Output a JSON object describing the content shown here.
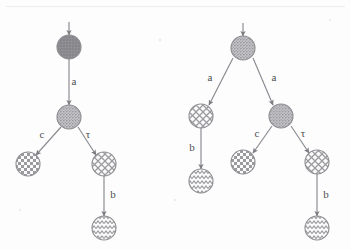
{
  "figure": {
    "background_color": "#fdfdfd",
    "node_outline_color": "#8e8e93",
    "edge_color": "#8a8a90",
    "label_color": "#4e4e52",
    "solid_fill_color": "#8b8b90",
    "stipple_fill_color": "#b0b0b4",
    "pattern_fill_color": "#9a9a9f",
    "node_radius": 12
  },
  "trees": [
    {
      "id": "left-tree",
      "name": "left-transition-tree",
      "nodes": [
        {
          "id": "L0",
          "pattern": "solid",
          "cx": 69,
          "cy": 47,
          "role": "root"
        },
        {
          "id": "L1",
          "pattern": "stipple",
          "cx": 69,
          "cy": 117,
          "role": "internal"
        },
        {
          "id": "L2",
          "pattern": "checkerboard",
          "cx": 28,
          "cy": 164,
          "role": "leaf"
        },
        {
          "id": "L3",
          "pattern": "crosshatch",
          "cx": 104,
          "cy": 164,
          "role": "internal"
        },
        {
          "id": "L4",
          "pattern": "wavy",
          "cx": 104,
          "cy": 228,
          "role": "leaf"
        }
      ],
      "edges": [
        {
          "from": "L0",
          "to": "L1",
          "label": "a",
          "label_x": 74,
          "label_y": 85
        },
        {
          "from": "L1",
          "to": "L2",
          "label": "c",
          "label_x": 42,
          "label_y": 138
        },
        {
          "from": "L1",
          "to": "L3",
          "label": "τ",
          "label_x": 88,
          "label_y": 138
        },
        {
          "from": "L3",
          "to": "L4",
          "label": "b",
          "label_x": 113,
          "label_y": 198
        }
      ],
      "entry_arrow": {
        "x": 69,
        "y_top": 22,
        "y_bottom": 35
      }
    },
    {
      "id": "right-tree",
      "name": "right-transition-tree",
      "nodes": [
        {
          "id": "R0",
          "pattern": "stipple",
          "cx": 243,
          "cy": 48,
          "role": "root"
        },
        {
          "id": "R1",
          "pattern": "crosshatch",
          "cx": 201,
          "cy": 116,
          "role": "internal"
        },
        {
          "id": "R2",
          "pattern": "wavy",
          "cx": 201,
          "cy": 181,
          "role": "leaf"
        },
        {
          "id": "R3",
          "pattern": "stipple",
          "cx": 281,
          "cy": 116,
          "role": "internal"
        },
        {
          "id": "R4",
          "pattern": "checkerboard",
          "cx": 243,
          "cy": 162,
          "role": "leaf"
        },
        {
          "id": "R5",
          "pattern": "crosshatch",
          "cx": 317,
          "cy": 162,
          "role": "internal"
        },
        {
          "id": "R6",
          "pattern": "wavy",
          "cx": 317,
          "cy": 228,
          "role": "leaf"
        }
      ],
      "edges": [
        {
          "from": "R0",
          "to": "R1",
          "label": "a",
          "label_x": 210,
          "label_y": 81
        },
        {
          "from": "R0",
          "to": "R3",
          "label": "a",
          "label_x": 274,
          "label_y": 81
        },
        {
          "from": "R1",
          "to": "R2",
          "label": "b",
          "label_x": 192,
          "label_y": 151
        },
        {
          "from": "R3",
          "to": "R4",
          "label": "c",
          "label_x": 257,
          "label_y": 137
        },
        {
          "from": "R3",
          "to": "R5",
          "label": "τ",
          "label_x": 303,
          "label_y": 137
        },
        {
          "from": "R5",
          "to": "R6",
          "label": "b",
          "label_x": 326,
          "label_y": 198
        }
      ],
      "entry_arrow": {
        "x": 243,
        "y_top": 23,
        "y_bottom": 36
      }
    }
  ]
}
